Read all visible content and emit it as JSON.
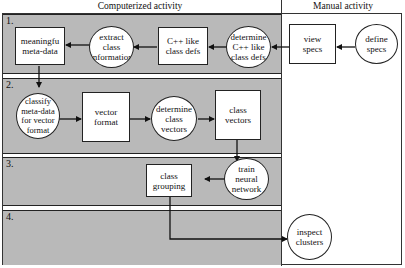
{
  "headers": {
    "computerized": "Computerized activity",
    "manual": "Manual activity"
  },
  "bands": [
    {
      "number": "1."
    },
    {
      "number": "2."
    },
    {
      "number": "3."
    },
    {
      "number": "4."
    }
  ],
  "nodes": {
    "meaningful_meta_data": {
      "label": "meaningfu\nmeta-data",
      "shape": "box"
    },
    "extract_class_information": {
      "label": "extract\nclass\ninformation",
      "shape": "circle"
    },
    "cpp_like_class_defs": {
      "label": "C++ like\nclass defs",
      "shape": "box"
    },
    "determine_cpp_like_class_defs": {
      "label": "determine\nC++ like\nclass defs",
      "shape": "circle"
    },
    "view_specs": {
      "label": "view\nspecs",
      "shape": "box"
    },
    "define_specs": {
      "label": "define\nspecs",
      "shape": "circle"
    },
    "classify_meta_data": {
      "label": "classify\nmeta-data\nfor vector\nformat",
      "shape": "circle"
    },
    "vector_format": {
      "label": "vector\nformat",
      "shape": "box"
    },
    "determine_class_vectors": {
      "label": "determine\nclass\nvectors",
      "shape": "circle"
    },
    "class_vectors": {
      "label": "class\nvectors",
      "shape": "box"
    },
    "train_neural_network": {
      "label": "train\nneural\nnetwork",
      "shape": "circle"
    },
    "class_grouping": {
      "label": "class\ngrouping",
      "shape": "box"
    },
    "inspect_clusters": {
      "label": "inspect\nclusters",
      "shape": "circle"
    }
  },
  "edges": [
    {
      "from": "define_specs",
      "to": "view_specs"
    },
    {
      "from": "view_specs",
      "to": "determine_cpp_like_class_defs"
    },
    {
      "from": "determine_cpp_like_class_defs",
      "to": "cpp_like_class_defs"
    },
    {
      "from": "cpp_like_class_defs",
      "to": "extract_class_information"
    },
    {
      "from": "extract_class_information",
      "to": "meaningful_meta_data"
    },
    {
      "from": "meaningful_meta_data",
      "to": "classify_meta_data"
    },
    {
      "from": "classify_meta_data",
      "to": "vector_format"
    },
    {
      "from": "vector_format",
      "to": "determine_class_vectors"
    },
    {
      "from": "determine_class_vectors",
      "to": "class_vectors"
    },
    {
      "from": "class_vectors",
      "to": "train_neural_network"
    },
    {
      "from": "train_neural_network",
      "to": "class_grouping"
    },
    {
      "from": "class_grouping",
      "to": "inspect_clusters"
    }
  ],
  "colors": {
    "band_fill": "#b9b9b9",
    "node_fill": "#ffffff",
    "stroke": "#222222"
  }
}
